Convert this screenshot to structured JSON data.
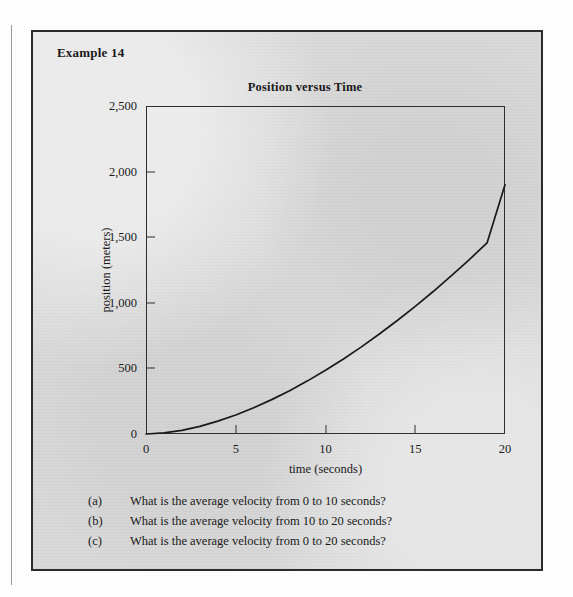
{
  "example": {
    "label": "Example 14"
  },
  "chart_data": {
    "type": "line",
    "title": "Position versus Time",
    "xlabel": "time (seconds)",
    "ylabel": "position (meters)",
    "xlim": [
      0,
      20
    ],
    "ylim": [
      0,
      2500
    ],
    "xticks": [
      0,
      5,
      10,
      15,
      20
    ],
    "xtick_labels": [
      "0",
      "5",
      "10",
      "15",
      "20"
    ],
    "yticks": [
      0,
      500,
      1000,
      1500,
      2000,
      2500
    ],
    "ytick_labels": [
      "0",
      "500",
      "1,000",
      "1,500",
      "2,000",
      "2,500"
    ],
    "grid": false,
    "legend": null,
    "series": [
      {
        "name": "position",
        "x": [
          0,
          1,
          2,
          3,
          4,
          5,
          6,
          7,
          8,
          9,
          10,
          11,
          12,
          13,
          14,
          15,
          16,
          17,
          18,
          19,
          20
        ],
        "values": [
          0,
          8,
          28,
          58,
          98,
          145,
          200,
          262,
          330,
          405,
          486,
          572,
          664,
          762,
          865,
          973,
          1086,
          1205,
          1328,
          1456,
          1900
        ]
      }
    ],
    "line_color": "#1a1a1a",
    "annotations": []
  },
  "questions": [
    {
      "marker": "(a)",
      "text": "What is the average velocity from 0 to 10 seconds?"
    },
    {
      "marker": "(b)",
      "text": "What is the average velocity from 10 to 20 seconds?"
    },
    {
      "marker": "(c)",
      "text": "What is the average velocity from 0 to 20 seconds?"
    }
  ],
  "colors": {
    "panel_background": "#d9d9d9",
    "border": "#2b2b2b",
    "ink": "#1a1a1a"
  }
}
